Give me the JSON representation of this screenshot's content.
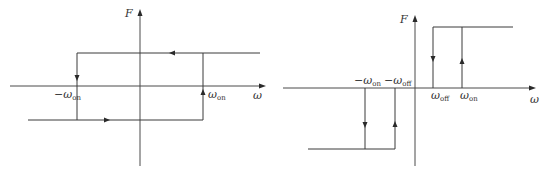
{
  "diagrams": [
    {
      "name": "symmetric-hysteresis",
      "axes": {
        "y_label": "F",
        "x_label": "ω"
      },
      "thresholds": [
        {
          "label_main": "−ω",
          "label_sub": "on"
        },
        {
          "label_main": "ω",
          "label_sub": "on"
        }
      ],
      "levels": [
        "+F",
        "−F"
      ],
      "transitions": [
        "top branch traversed right-to-left",
        "switch down at −ω_on",
        "bottom branch traversed left-to-right",
        "switch up at ω_on"
      ]
    },
    {
      "name": "dead-zone-hysteresis",
      "axes": {
        "y_label": "F",
        "x_label": "ω"
      },
      "thresholds": [
        {
          "label_main": "−ω",
          "label_sub": "on"
        },
        {
          "label_main": "−ω",
          "label_sub": "off"
        },
        {
          "label_main": "ω",
          "label_sub": "off"
        },
        {
          "label_main": "ω",
          "label_sub": "on"
        }
      ],
      "levels": [
        "+F",
        "0",
        "−F"
      ],
      "transitions": [
        "switch on (up) at ω_on",
        "switch off (down) at ω_off",
        "switch on (down) at −ω_on",
        "switch off (up) at −ω_off"
      ]
    }
  ],
  "colors": {
    "line": "#3a3a3a",
    "background": "#ffffff"
  }
}
